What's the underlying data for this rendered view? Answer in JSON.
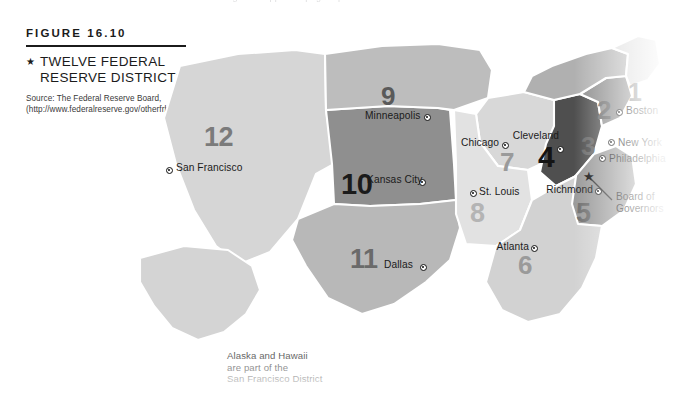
{
  "figure": {
    "number_label": "FIGURE 16.10",
    "bullet": "star-bullet",
    "title": "TWELVE FEDERAL RESERVE DISTRICTS",
    "source": "Source: The Federal Reserve Board, (http://www.federalreserve.gov/otherfrb.htm)"
  },
  "map": {
    "note": "Alaska and Hawaii are part of the San Francisco District",
    "board_of_governors_label": "Board of Governors",
    "board_of_governors_marker": "star",
    "districts": [
      {
        "number": "1",
        "bank_city": "Boston",
        "fill": "#dcdcdc",
        "num_color": "#6f6f6f"
      },
      {
        "number": "2",
        "bank_city": "New York",
        "fill": "#b0b0b0",
        "num_color": "#6a6a6a"
      },
      {
        "number": "3",
        "bank_city": "Philadelphia",
        "fill": "#8e8e8e",
        "num_color": "#6a6a6a"
      },
      {
        "number": "4",
        "bank_city": "Cleveland",
        "fill": "#4f4f4f",
        "num_color": "#1b1b1b"
      },
      {
        "number": "5",
        "bank_city": "Richmond",
        "fill": "#9a9a9a",
        "num_color": "#6f6f6f"
      },
      {
        "number": "6",
        "bank_city": "Atlanta",
        "fill": "#d2d2d2",
        "num_color": "#9a9a9a"
      },
      {
        "number": "7",
        "bank_city": "Chicago",
        "fill": "#d8d8d8",
        "num_color": "#9a9a9a"
      },
      {
        "number": "8",
        "bank_city": "St. Louis",
        "fill": "#e2e2e2",
        "num_color": "#b4b4b4"
      },
      {
        "number": "9",
        "bank_city": "Minneapolis",
        "fill": "#bdbdbd",
        "num_color": "#5a5a5a"
      },
      {
        "number": "10",
        "bank_city": "Kansas City",
        "fill": "#8f8f8f",
        "num_color": "#1b1b1b"
      },
      {
        "number": "11",
        "bank_city": "Dallas",
        "fill": "#b8b8b8",
        "num_color": "#6a6a6a"
      },
      {
        "number": "12",
        "bank_city": "San Francisco",
        "fill": "#d6d6d6",
        "num_color": "#7b7b7b"
      }
    ],
    "city_labels": [
      {
        "name": "Boston"
      },
      {
        "name": "New York"
      },
      {
        "name": "Philadelphia"
      },
      {
        "name": "Cleveland"
      },
      {
        "name": "Richmond"
      },
      {
        "name": "Atlanta"
      },
      {
        "name": "Chicago"
      },
      {
        "name": "St. Louis"
      },
      {
        "name": "Minneapolis"
      },
      {
        "name": "Kansas City"
      },
      {
        "name": "Dallas"
      },
      {
        "name": "San Francisco"
      }
    ]
  },
  "top_cut_text": "running text clipped at page top"
}
